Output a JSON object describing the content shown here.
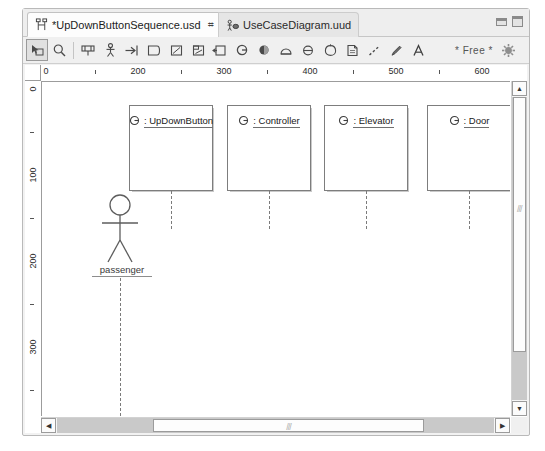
{
  "window": {
    "min_label": "minimize",
    "max_label": "maximize"
  },
  "tabs": [
    {
      "label": "*UpDownButtonSequence.usd",
      "icon": "sequence-diagram-icon",
      "close": "⌗",
      "active": true
    },
    {
      "label": "UseCaseDiagram.uud",
      "icon": "usecase-diagram-icon",
      "close": "",
      "active": false
    }
  ],
  "toolbar": {
    "free_label": "* Free *",
    "buttons": [
      {
        "name": "select-tool",
        "icon": "cursor-select-icon"
      },
      {
        "name": "zoom-tool",
        "icon": "magnifier-icon"
      },
      {
        "name": "package-tool",
        "icon": "package-icon"
      },
      {
        "name": "actor-tool",
        "icon": "actor-icon"
      },
      {
        "name": "message-tool",
        "icon": "arrow-message-icon"
      },
      {
        "name": "note-tool",
        "icon": "note-icon"
      },
      {
        "name": "frame-tool",
        "icon": "frame-icon"
      },
      {
        "name": "combined-fragment-tool",
        "icon": "combined-fragment-icon"
      },
      {
        "name": "lifeline-tool",
        "icon": "lifeline-icon"
      },
      {
        "name": "object-tool",
        "icon": "object-circle-icon"
      },
      {
        "name": "interface-tool",
        "icon": "interface-ball-icon"
      },
      {
        "name": "state-tool",
        "icon": "state-icon"
      },
      {
        "name": "port-tool",
        "icon": "port-icon"
      },
      {
        "name": "component-tool",
        "icon": "component-round-icon"
      },
      {
        "name": "document-tool",
        "icon": "document-icon"
      },
      {
        "name": "dependency-tool",
        "icon": "dashed-line-icon"
      },
      {
        "name": "association-tool",
        "icon": "pen-icon"
      },
      {
        "name": "text-tool",
        "icon": "text-a-icon"
      },
      {
        "name": "settings-tool",
        "icon": "gear-sun-icon"
      }
    ]
  },
  "rulers": {
    "horizontal": {
      "labels": [
        "0",
        "200",
        "300",
        "400",
        "500",
        "600"
      ],
      "label_x": [
        3,
        93,
        179,
        265,
        351,
        437
      ],
      "tick_x": [
        50,
        136,
        222,
        308,
        394,
        466
      ]
    },
    "vertical": {
      "labels": [
        "0",
        "100",
        "200",
        "300"
      ],
      "label_y": [
        5,
        88,
        174,
        260
      ],
      "tick_y": [
        46,
        131,
        217,
        303
      ]
    }
  },
  "diagram": {
    "actor": {
      "name": "actor-passenger",
      "label": "passenger",
      "lifeline_height": 188
    },
    "lifelines": [
      {
        "name": ": UpDownButton",
        "icon": "object-circle-icon",
        "x": 87,
        "width": 84,
        "height": 86,
        "stem": 38
      },
      {
        "name": ": Controller",
        "icon": "object-circle-icon",
        "x": 185,
        "width": 84,
        "height": 86,
        "stem": 38
      },
      {
        "name": ": Elevator",
        "icon": "object-circle-icon",
        "x": 282,
        "width": 84,
        "height": 86,
        "stem": 38
      },
      {
        "name": ": Door",
        "icon": "object-circle-icon",
        "x": 385,
        "width": 84,
        "height": 86,
        "stem": 38
      }
    ]
  },
  "scrollbars": {
    "horizontal": {
      "left_arrow": "◀",
      "right_arrow": "▶",
      "thumb_left_pct": 22,
      "thumb_width_pct": 62,
      "grip": "///"
    },
    "vertical": {
      "up_arrow": "▲",
      "down_arrow": "▼",
      "thumb_top_pct": 0,
      "thumb_height_pct": 84,
      "grip": "///"
    }
  }
}
